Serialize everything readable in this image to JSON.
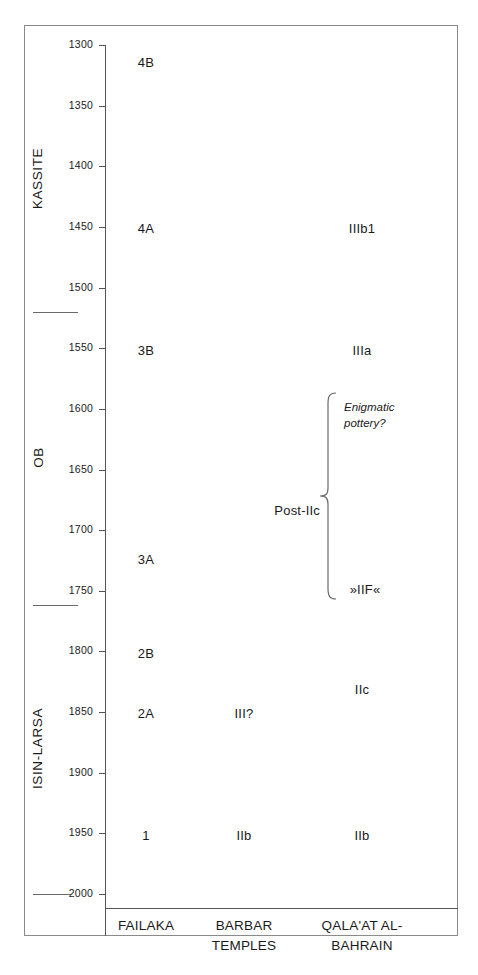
{
  "figure": {
    "kind": "archaeological-chronology-chart",
    "axis": {
      "name": "BC date axis",
      "ticks": [
        1300,
        1350,
        1400,
        1450,
        1500,
        1550,
        1600,
        1650,
        1700,
        1750,
        1800,
        1850,
        1900,
        1950,
        2000
      ],
      "tick_labels": [
        "1300",
        "1350",
        "1400",
        "1450",
        "1500",
        "1550",
        "1600",
        "1650",
        "1700",
        "1750",
        "1800",
        "1850",
        "1900",
        "1950",
        "2000"
      ]
    },
    "period_bands": [
      {
        "label": "KASSITE",
        "center": 1410
      },
      {
        "label": "OB",
        "center": 1640
      },
      {
        "label": "ISIN-LARSA",
        "center": 1880
      }
    ],
    "band_dividers": [
      1520,
      1762
    ],
    "columns": [
      {
        "key": "failaka",
        "header_lines": [
          "FAILAKA"
        ]
      },
      {
        "key": "barbar",
        "header_lines": [
          "BARBAR",
          "TEMPLES"
        ]
      },
      {
        "key": "qalaat",
        "header_lines": [
          "QALA'AT AL-",
          "BAHRAIN"
        ]
      }
    ],
    "entries": {
      "failaka": [
        {
          "label": "4B",
          "date": 1315
        },
        {
          "label": "4A",
          "date": 1452
        },
        {
          "label": "3B",
          "date": 1552
        },
        {
          "label": "3A",
          "date": 1725
        },
        {
          "label": "2B",
          "date": 1802
        },
        {
          "label": "2A",
          "date": 1852
        },
        {
          "label": "1",
          "date": 1952
        }
      ],
      "barbar": [
        {
          "label": "III?",
          "date": 1852
        },
        {
          "label": "IIb",
          "date": 1952
        }
      ],
      "qalaat": [
        {
          "label": "IIIb1",
          "date": 1452
        },
        {
          "label": "IIIa",
          "date": 1552
        },
        {
          "label": "IIc",
          "date": 1832
        },
        {
          "label": "IIb",
          "date": 1952
        }
      ]
    },
    "brace": {
      "label": "Post-IIc",
      "top_date": 1600,
      "bottom_date": 1771,
      "note": [
        "Enigmatic",
        "pottery?"
      ],
      "bottom_entry": "»IIF«"
    }
  },
  "chart_data": {
    "type": "table",
    "xlabel": "",
    "ylabel": "BC",
    "ylim": [
      1300,
      2000
    ],
    "y_inverted": false,
    "grid": false,
    "legend": "none",
    "y_ticks": [
      1300,
      1350,
      1400,
      1450,
      1500,
      1550,
      1600,
      1650,
      1700,
      1750,
      1800,
      1850,
      1900,
      1950,
      2000
    ],
    "categories": [
      "FAILAKA",
      "BARBAR TEMPLES",
      "QALA'AT AL-BAHRAIN"
    ],
    "annotations": [
      {
        "text": "KASSITE",
        "kind": "period-band",
        "range": [
          1300,
          1520
        ]
      },
      {
        "text": "OB",
        "kind": "period-band",
        "range": [
          1520,
          1762
        ]
      },
      {
        "text": "ISIN-LARSA",
        "kind": "period-band",
        "range": [
          1762,
          2000
        ]
      },
      {
        "text": "Post-IIc",
        "kind": "brace-group",
        "range": [
          1600,
          1771
        ]
      },
      {
        "text": "Enigmatic pottery?",
        "kind": "italic-note",
        "date": 1610
      },
      {
        "text": "»IIF«",
        "kind": "phase",
        "date": 1762
      }
    ],
    "series": [
      {
        "name": "FAILAKA",
        "points": [
          {
            "label": "4B",
            "date": 1315
          },
          {
            "label": "4A",
            "date": 1452
          },
          {
            "label": "3B",
            "date": 1552
          },
          {
            "label": "3A",
            "date": 1725
          },
          {
            "label": "2B",
            "date": 1802
          },
          {
            "label": "2A",
            "date": 1852
          },
          {
            "label": "1",
            "date": 1952
          }
        ]
      },
      {
        "name": "BARBAR TEMPLES",
        "points": [
          {
            "label": "III?",
            "date": 1852
          },
          {
            "label": "IIb",
            "date": 1952
          }
        ]
      },
      {
        "name": "QALA'AT AL-BAHRAIN",
        "points": [
          {
            "label": "IIIb1",
            "date": 1452
          },
          {
            "label": "IIIa",
            "date": 1552
          },
          {
            "label": "IIc",
            "date": 1832
          },
          {
            "label": "»IIF«",
            "date": 1762
          },
          {
            "label": "IIb",
            "date": 1952
          }
        ]
      }
    ]
  }
}
